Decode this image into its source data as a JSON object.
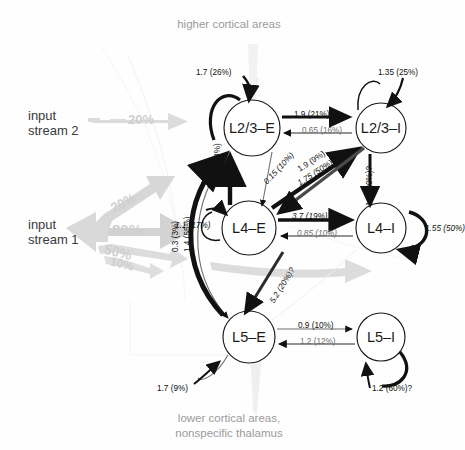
{
  "diagram": {
    "title_top": "higher cortical areas",
    "title_bottom_line1": "lower cortical areas,",
    "title_bottom_line2": "nonspecific thalamus"
  },
  "inputs": [
    {
      "name": "input-stream-2",
      "line1": "input",
      "line2": "stream 2",
      "pct": "20%"
    },
    {
      "name": "input-stream-1",
      "line1": "input",
      "line2": "stream 1",
      "branches": [
        "20%",
        "80%",
        "50%",
        "10%"
      ]
    }
  ],
  "nodes": [
    {
      "id": "l23e",
      "label": "L2/3–E"
    },
    {
      "id": "l23i",
      "label": "L2/3–I"
    },
    {
      "id": "l4e",
      "label": "L4–E"
    },
    {
      "id": "l4i",
      "label": "L4–I"
    },
    {
      "id": "l5e",
      "label": "L5–E"
    },
    {
      "id": "l5i",
      "label": "L5–I"
    }
  ],
  "self_loops": [
    {
      "node": "l23e",
      "label": "1.7 (26%)"
    },
    {
      "node": "l23i",
      "label": "1.35 (25%)"
    },
    {
      "node": "l4e",
      "label": "1.1 (17%)"
    },
    {
      "node": "l4i",
      "label": "1.55 (50%)"
    },
    {
      "node": "l5e",
      "label": "1.7 (9%)"
    },
    {
      "node": "l5i",
      "label": "1.2 (60%)?"
    }
  ],
  "connections": [
    {
      "from": "l23e",
      "to": "l23i",
      "label": "1.9 (21%)"
    },
    {
      "from": "l23i",
      "to": "l23e",
      "label": "0.65 (16%)"
    },
    {
      "from": "l4e",
      "to": "l4i",
      "label": "3.7 (19%)"
    },
    {
      "from": "l4i",
      "to": "l4e",
      "label": "0.85 (10%)"
    },
    {
      "from": "l5e",
      "to": "l5i",
      "label": "0.9 (10%)"
    },
    {
      "from": "l5i",
      "to": "l5e",
      "label": "1.2 (12%)"
    },
    {
      "from": "l4e",
      "to": "l23e",
      "label": "4 (28%)"
    },
    {
      "from": "l23e",
      "to": "l4e",
      "label": "0.15 (10%)"
    },
    {
      "from": "l4e",
      "to": "l23i",
      "label": "1.9 (9%)"
    },
    {
      "from": "l23i",
      "to": "l4e",
      "label": "1.75 (50%)"
    },
    {
      "from": "l23e",
      "to": "l5e",
      "label": "0.3 (3%)"
    },
    {
      "from": "l5e",
      "to": "l23e",
      "label": "1.4 (55%)"
    },
    {
      "from": "l23i",
      "to": "l4i",
      "label": "1.5 (20%)?"
    },
    {
      "from": "l4e",
      "to": "l5e",
      "label": "5.2 (20%)?"
    }
  ],
  "colors": {
    "node_stroke": "#1b1b1b",
    "arrow_dark": "#111111",
    "arrow_gray": "#6f6f6f",
    "ghost_gray": "#d9d9d9",
    "text_gray": "#9b9b9b"
  }
}
